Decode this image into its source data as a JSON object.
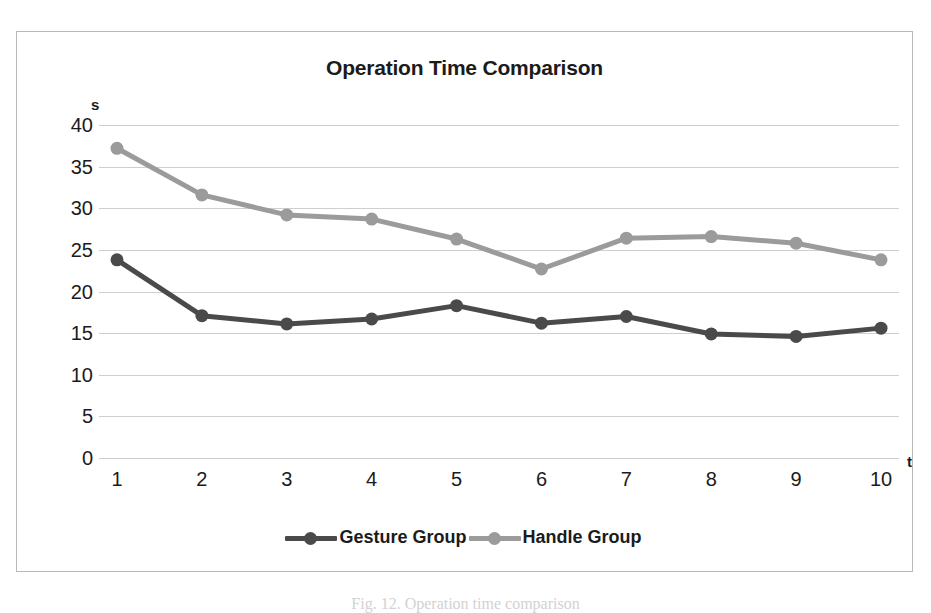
{
  "chart_data": {
    "type": "line",
    "title": "Operation Time Comparison",
    "xlabel": "t",
    "ylabel": "s",
    "categories": [
      "1",
      "2",
      "3",
      "4",
      "5",
      "6",
      "7",
      "8",
      "9",
      "10"
    ],
    "x": [
      1,
      2,
      3,
      4,
      5,
      6,
      7,
      8,
      9,
      10
    ],
    "series": [
      {
        "name": "Gesture Group",
        "color": "#4a4a4a",
        "values": [
          23.8,
          17.1,
          16.1,
          16.7,
          18.3,
          16.2,
          17.0,
          14.9,
          14.6,
          15.6
        ]
      },
      {
        "name": "Handle Group",
        "color": "#9b9b9b",
        "values": [
          37.2,
          31.6,
          29.2,
          28.7,
          26.3,
          22.7,
          26.4,
          26.6,
          25.8,
          23.8
        ]
      }
    ],
    "ylim": [
      0,
      40
    ],
    "yticks": [
      0,
      5,
      10,
      15,
      20,
      25,
      30,
      35,
      40
    ],
    "ytick_labels": [
      "0",
      "5",
      "10",
      "15",
      "20",
      "25",
      "30",
      "35",
      "40"
    ],
    "xlim": [
      1,
      10
    ],
    "grid": true,
    "grid_axis": "y",
    "legend_position": "bottom",
    "marker": "circle"
  },
  "figure": {
    "caption": "Fig. 12. Operation time comparison"
  }
}
